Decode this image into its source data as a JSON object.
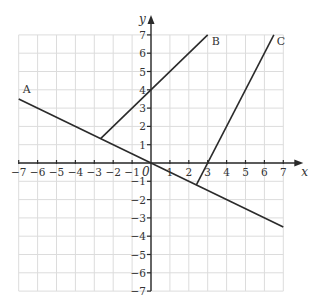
{
  "diagram": {
    "axes": {
      "x_label": "x",
      "y_label": "y",
      "origin_label": "0",
      "x_range": [
        -7,
        7
      ],
      "y_range": [
        -7,
        7
      ],
      "x_ticks": [
        "-7",
        "-6",
        "-5",
        "-4",
        "-3",
        "-2",
        "-1",
        "1",
        "2",
        "3",
        "4",
        "5",
        "6",
        "7"
      ],
      "y_ticks": [
        "7",
        "6",
        "5",
        "4",
        "3",
        "2",
        "1",
        "-1",
        "-2",
        "-3",
        "-4",
        "-5",
        "-6",
        "-7"
      ]
    },
    "lines": [
      {
        "label": "A",
        "equation": "y = -x/2",
        "from": [
          -7,
          3.5
        ],
        "to": [
          7,
          -3.5
        ]
      },
      {
        "label": "B",
        "equation": "y = x + 4",
        "from": [
          -2.667,
          1.333
        ],
        "to": [
          3,
          7
        ]
      },
      {
        "label": "C",
        "equation": "y = 2x - 6",
        "from": [
          2.4,
          -1.2
        ],
        "to": [
          6.5,
          7
        ]
      }
    ],
    "colors": {
      "grid": "#dcdcdc",
      "axis": "#2a2a2a",
      "line": "#2b2b2b"
    }
  }
}
